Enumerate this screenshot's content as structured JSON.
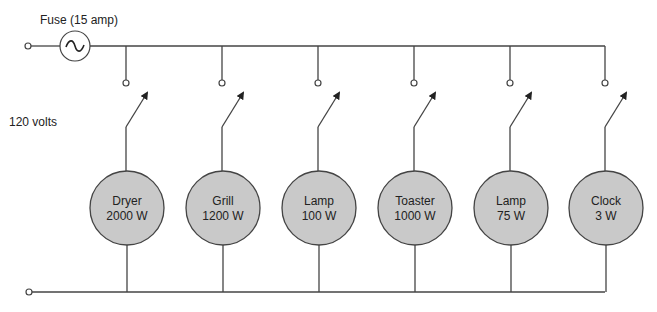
{
  "labels": {
    "fuse": "Fuse (15 amp)",
    "voltage": "120 volts"
  },
  "colors": {
    "wire": "#444444",
    "load_fill": "#c9c9c9",
    "background": "#ffffff"
  },
  "loads": [
    {
      "name": "Dryer",
      "power": "2000 W"
    },
    {
      "name": "Grill",
      "power": "1200 W"
    },
    {
      "name": "Lamp",
      "power": "100 W"
    },
    {
      "name": "Toaster",
      "power": "1000 W"
    },
    {
      "name": "Lamp",
      "power": "75 W"
    },
    {
      "name": "Clock",
      "power": "3 W"
    }
  ]
}
